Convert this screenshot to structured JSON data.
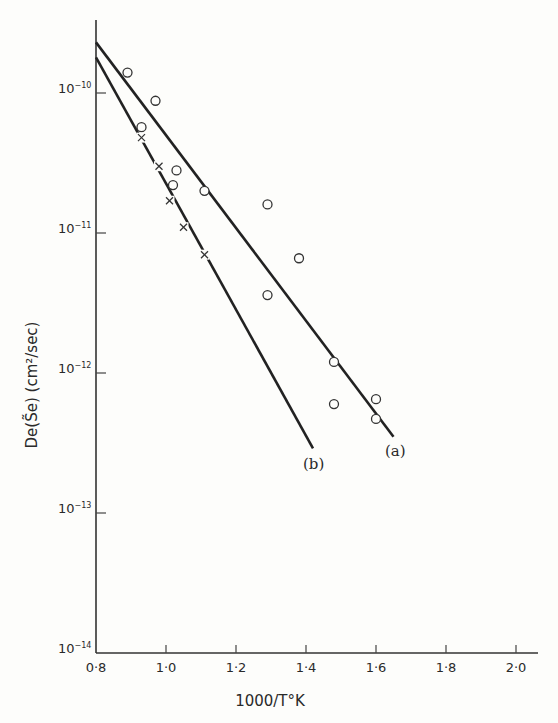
{
  "chart_data": {
    "type": "scatter",
    "title": "",
    "xlabel": "1000/T°K",
    "ylabel": "De(S̃e) (cm²/sec)",
    "x_ticks": [
      "0·8",
      "1·0",
      "1·2",
      "1·4",
      "1·6",
      "1·8",
      "2·0"
    ],
    "y_ticks": [
      "10-10",
      "10-11",
      "10-12",
      "10-13",
      "10-14"
    ],
    "y_scale": "log",
    "xlim": [
      0.8,
      2.05
    ],
    "ylim": [
      1e-14,
      4e-10
    ],
    "grid": false,
    "series": [
      {
        "name": "(a)",
        "marker": "circle",
        "points": [
          {
            "x": 0.89,
            "y": 1.4e-10
          },
          {
            "x": 0.97,
            "y": 8.8e-11
          },
          {
            "x": 0.93,
            "y": 5.7e-11
          },
          {
            "x": 1.03,
            "y": 2.8e-11
          },
          {
            "x": 1.02,
            "y": 2.2e-11
          },
          {
            "x": 1.11,
            "y": 2e-11
          },
          {
            "x": 1.29,
            "y": 1.6e-11
          },
          {
            "x": 1.38,
            "y": 6.6e-12
          },
          {
            "x": 1.29,
            "y": 3.6e-12
          },
          {
            "x": 1.48,
            "y": 1.2e-12
          },
          {
            "x": 1.48,
            "y": 6e-13
          },
          {
            "x": 1.6,
            "y": 6.5e-13
          },
          {
            "x": 1.6,
            "y": 4.7e-13
          }
        ],
        "fit_line": {
          "x": [
            0.8,
            1.65
          ],
          "y": [
            2.3e-10,
            3.5e-13
          ]
        }
      },
      {
        "name": "(b)",
        "marker": "cross",
        "points": [
          {
            "x": 0.93,
            "y": 4.8e-11
          },
          {
            "x": 0.98,
            "y": 3e-11
          },
          {
            "x": 1.01,
            "y": 1.7e-11
          },
          {
            "x": 1.05,
            "y": 1.1e-11
          },
          {
            "x": 1.11,
            "y": 7e-12
          }
        ],
        "fit_line": {
          "x": [
            0.8,
            1.42
          ],
          "y": [
            1.8e-10,
            2.9e-13
          ]
        }
      }
    ],
    "annotations": [
      "(a)",
      "(b)"
    ]
  },
  "labels": {
    "xlabel": "1000/T°K",
    "ylabel": "De(S̃e) (cm²/sec)",
    "line_a": "(a)",
    "line_b": "(b)",
    "xticks": [
      "0·8",
      "1·0",
      "1·2",
      "1·4",
      "1·6",
      "1·8",
      "2·0"
    ],
    "ybase": "10",
    "yexp": [
      "−10",
      "−11",
      "−12",
      "−13",
      "−14"
    ]
  }
}
